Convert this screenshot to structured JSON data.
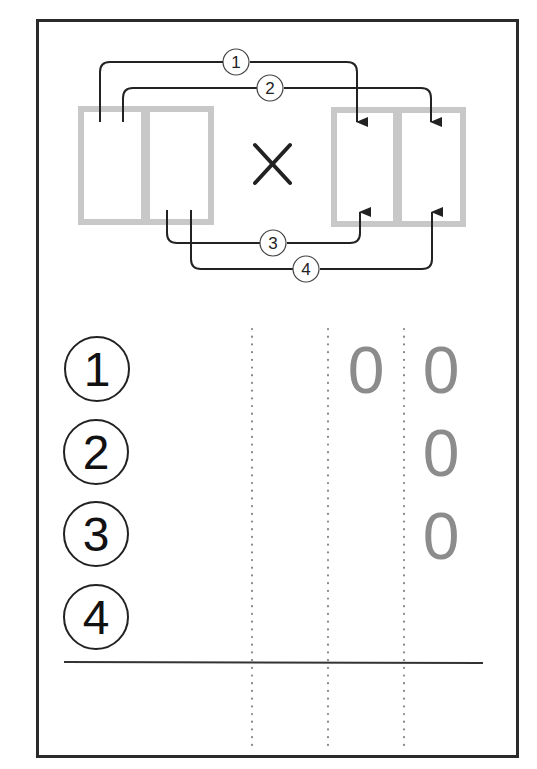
{
  "diagram": {
    "operator": "×",
    "left_factor_boxes": 2,
    "right_factor_boxes": 2,
    "arrow_labels": [
      "1",
      "2",
      "3",
      "4"
    ],
    "colors": {
      "box_border": "#c8c8c8",
      "line": "#222222",
      "digit": "#8c8c8c",
      "sheet_border": "#2a2a2a"
    }
  },
  "worksheet": {
    "row_labels": [
      "1",
      "2",
      "3",
      "4"
    ],
    "columns": 4,
    "rows": [
      {
        "label": "1",
        "digits": [
          "",
          "",
          "0",
          "0"
        ]
      },
      {
        "label": "2",
        "digits": [
          "",
          "",
          "",
          "0"
        ]
      },
      {
        "label": "3",
        "digits": [
          "",
          "",
          "",
          "0"
        ]
      },
      {
        "label": "4",
        "digits": [
          "",
          "",
          "",
          ""
        ]
      }
    ],
    "result_row": [
      "",
      "",
      "",
      ""
    ]
  }
}
